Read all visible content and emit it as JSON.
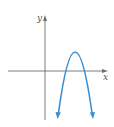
{
  "figure": {
    "type": "graph",
    "axes": {
      "x_label": "x",
      "y_label": "y"
    },
    "colors": {
      "axis": "#6e6e6e",
      "curve": "#3a8fd0",
      "background": "#ffffff"
    },
    "curve": {
      "shape": "parabola",
      "opens": "down",
      "vertex_position": "above x-axis, right of y-axis",
      "x_intercepts": 2,
      "ends": "arrows pointing downward"
    }
  }
}
